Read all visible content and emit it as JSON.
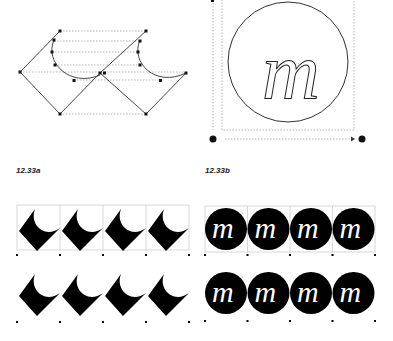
{
  "figures": [
    {
      "id": "a",
      "label": "12.33a",
      "description": "Diamond tile with concave crescent cut constructed from Bezier curves"
    },
    {
      "id": "b",
      "label": "12.33b",
      "description": "Circle tile containing outlined italic letter m"
    }
  ],
  "tile_glyph": "m",
  "colors": {
    "ink": "#000000",
    "guide": "#9a9a9a",
    "grid": "#bdbdbd",
    "paper": "#ffffff"
  },
  "rows": {
    "pattern_a_tiles_per_row": 4,
    "pattern_b_tiles_per_row": 4,
    "row_count": 2
  }
}
